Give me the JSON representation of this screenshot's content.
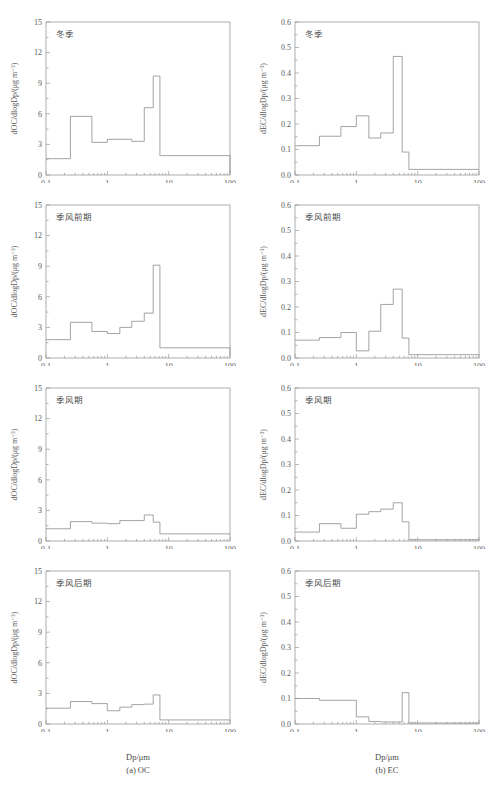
{
  "figure": {
    "caption_left": "(a) OC",
    "caption_right": "(b) EC",
    "xlabel": "Dp/μm"
  },
  "axes": {
    "x_ticks": [
      "0.1",
      "1",
      "10",
      "100"
    ],
    "x_min": 0.1,
    "x_max": 100,
    "oc_y_ticks": [
      "0",
      "3",
      "6",
      "9",
      "12",
      "15"
    ],
    "oc_y_min": 0,
    "oc_y_max": 15,
    "ec_y_ticks": [
      "0.0",
      "0.1",
      "0.2",
      "0.3",
      "0.4",
      "0.5",
      "0.6"
    ],
    "ec_y_min": 0,
    "ec_y_max": 0.6,
    "oc_ylabel": "dOC/dlogDp/(μg m⁻³)",
    "ec_ylabel": "dEC/dlogDp/(μg m⁻³)"
  },
  "seasons": {
    "winter": "冬季",
    "pre_monsoon": "季风前期",
    "monsoon": "季风期",
    "post_monsoon": "季风后期"
  },
  "chart_data": [
    {
      "type": "line",
      "id": "oc-winter",
      "title": "冬季",
      "panel": "(a) OC",
      "xlabel": "Dp/μm",
      "ylabel": "dOC/dlogDp/(μg m⁻³)",
      "xscale": "log",
      "xlim": [
        0.1,
        100
      ],
      "ylim": [
        0,
        15
      ],
      "grid": false,
      "legend": "none",
      "bin_edges": [
        0.1,
        0.25,
        0.56,
        1.0,
        1.6,
        2.5,
        4.0,
        5.6,
        7.2,
        100
      ],
      "values": [
        1.6,
        5.75,
        3.2,
        3.5,
        3.5,
        3.3,
        6.6,
        9.7,
        1.9,
        0.2
      ]
    },
    {
      "type": "line",
      "id": "ec-winter",
      "title": "冬季",
      "panel": "(b) EC",
      "xlabel": "Dp/μm",
      "ylabel": "dEC/dlogDp/(μg m⁻³)",
      "xscale": "log",
      "xlim": [
        0.1,
        100
      ],
      "ylim": [
        0,
        0.6
      ],
      "grid": false,
      "legend": "none",
      "bin_edges": [
        0.1,
        0.25,
        0.56,
        1.0,
        1.6,
        2.5,
        4.0,
        5.6,
        7.2,
        100
      ],
      "values": [
        0.115,
        0.152,
        0.19,
        0.232,
        0.145,
        0.165,
        0.465,
        0.09,
        0.022,
        0.022
      ]
    },
    {
      "type": "line",
      "id": "oc-pre-monsoon",
      "title": "季风前期",
      "panel": "(a) OC",
      "xlabel": "Dp/μm",
      "ylabel": "dOC/dlogDp/(μg m⁻³)",
      "xscale": "log",
      "xlim": [
        0.1,
        100
      ],
      "ylim": [
        0,
        15
      ],
      "grid": false,
      "legend": "none",
      "bin_edges": [
        0.1,
        0.25,
        0.56,
        1.0,
        1.6,
        2.5,
        4.0,
        5.6,
        7.2,
        100
      ],
      "values": [
        1.8,
        3.5,
        2.6,
        2.4,
        3.0,
        3.6,
        4.4,
        9.1,
        1.0,
        0.3
      ]
    },
    {
      "type": "line",
      "id": "ec-pre-monsoon",
      "title": "季风前期",
      "panel": "(b) EC",
      "xlabel": "Dp/μm",
      "ylabel": "dEC/dlogDp/(μg m⁻³)",
      "xscale": "log",
      "xlim": [
        0.1,
        100
      ],
      "ylim": [
        0,
        0.6
      ],
      "grid": false,
      "legend": "none",
      "bin_edges": [
        0.1,
        0.25,
        0.56,
        1.0,
        1.6,
        2.5,
        4.0,
        5.6,
        7.2,
        100
      ],
      "values": [
        0.07,
        0.08,
        0.1,
        0.028,
        0.105,
        0.21,
        0.27,
        0.078,
        0.013,
        0.013
      ]
    },
    {
      "type": "line",
      "id": "oc-monsoon",
      "title": "季风期",
      "panel": "(a) OC",
      "xlabel": "Dp/μm",
      "ylabel": "dOC/dlogDp/(μg m⁻³)",
      "xscale": "log",
      "xlim": [
        0.1,
        100
      ],
      "ylim": [
        0,
        15
      ],
      "grid": false,
      "legend": "none",
      "bin_edges": [
        0.1,
        0.25,
        0.56,
        1.0,
        1.6,
        2.5,
        4.0,
        5.6,
        7.2,
        100
      ],
      "values": [
        1.2,
        1.9,
        1.75,
        1.7,
        2.0,
        2.0,
        2.55,
        1.85,
        0.7,
        0.6
      ]
    },
    {
      "type": "line",
      "id": "ec-monsoon",
      "title": "季风期",
      "panel": "(b) EC",
      "xlabel": "Dp/μm",
      "ylabel": "dEC/dlogDp/(μg m⁻³)",
      "xscale": "log",
      "xlim": [
        0.1,
        100
      ],
      "ylim": [
        0,
        0.6
      ],
      "grid": false,
      "legend": "none",
      "bin_edges": [
        0.1,
        0.25,
        0.56,
        1.0,
        1.6,
        2.5,
        4.0,
        5.6,
        7.2,
        100
      ],
      "values": [
        0.035,
        0.068,
        0.05,
        0.105,
        0.115,
        0.125,
        0.15,
        0.075,
        0.005,
        0.005
      ]
    },
    {
      "type": "line",
      "id": "oc-post-monsoon",
      "title": "季风后期",
      "panel": "(a) OC",
      "xlabel": "Dp/μm",
      "ylabel": "dOC/dlogDp/(μg m⁻³)",
      "xscale": "log",
      "xlim": [
        0.1,
        100
      ],
      "ylim": [
        0,
        15
      ],
      "grid": false,
      "legend": "none",
      "bin_edges": [
        0.1,
        0.25,
        0.56,
        1.0,
        1.6,
        2.5,
        4.0,
        5.6,
        7.2,
        100
      ],
      "values": [
        1.55,
        2.2,
        2.0,
        1.3,
        1.65,
        1.9,
        1.95,
        2.85,
        0.4,
        0.35
      ]
    },
    {
      "type": "line",
      "id": "ec-post-monsoon",
      "title": "季风后期",
      "panel": "(b) EC",
      "xlabel": "Dp/μm",
      "ylabel": "dEC/dlogDp/(μg m⁻³)",
      "xscale": "log",
      "xlim": [
        0.1,
        100
      ],
      "ylim": [
        0,
        0.6
      ],
      "grid": false,
      "legend": "none",
      "bin_edges": [
        0.1,
        0.25,
        0.56,
        1.0,
        1.6,
        2.5,
        4.0,
        5.6,
        7.2,
        100
      ],
      "values": [
        0.1,
        0.093,
        0.093,
        0.028,
        0.01,
        0.008,
        0.008,
        0.123,
        0.004,
        0.004
      ]
    }
  ]
}
